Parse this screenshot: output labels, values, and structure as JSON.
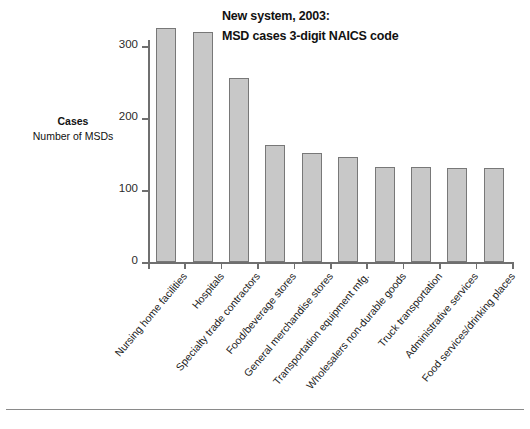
{
  "title": {
    "line1": "New system, 2003:",
    "line2": "MSD cases 3-digit NAICS code"
  },
  "y_axis": {
    "caption_main": "Cases",
    "caption_sub": "Number of MSDs",
    "ticks": [
      "0",
      "100",
      "200",
      "300"
    ]
  },
  "chart_data": {
    "type": "bar",
    "title": "New system, 2003: MSD cases 3-digit NAICS code",
    "xlabel": "",
    "ylabel": "Cases / Number of MSDs",
    "ylim": [
      0,
      340
    ],
    "yticks": [
      0,
      100,
      200,
      300
    ],
    "grid": false,
    "legend": "none",
    "bar_color": "#c8c8c8",
    "bar_edge_color": "#787878",
    "categories": [
      "Nursing home facilities",
      "Hospitals",
      "Specialty trade contractors",
      "Food/beverage stores",
      "General merchandise stores",
      "Transportation equipment mfg.",
      "Wholesalers non-durable goods",
      "Truck transportation",
      "Administrative services",
      "Food services/drinking places"
    ],
    "values": [
      325,
      320,
      255,
      162,
      152,
      146,
      132,
      132,
      131,
      131
    ]
  }
}
